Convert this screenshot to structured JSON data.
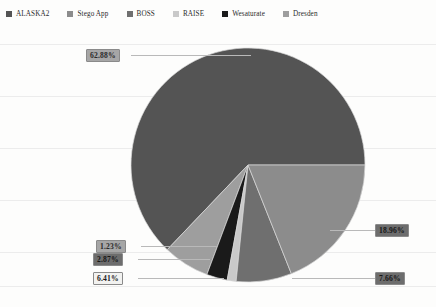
{
  "legend": {
    "position": "top",
    "items": [
      {
        "label": "ALASKA2",
        "color": "#545454",
        "icon": "legend-swatch-icon"
      },
      {
        "label": "Stego App",
        "color": "#8c8c8c",
        "icon": "legend-swatch-icon"
      },
      {
        "label": "BOSS",
        "color": "#6f6f6f",
        "icon": "legend-swatch-icon"
      },
      {
        "label": "RAISE",
        "color": "#c9c9c9",
        "icon": "legend-swatch-icon"
      },
      {
        "label": "Wesaturate",
        "color": "#1a1a1a",
        "icon": "legend-swatch-icon"
      },
      {
        "label": "Dresden",
        "color": "#9e9e9e",
        "icon": "legend-swatch-icon"
      }
    ]
  },
  "labels": {
    "alaska2": "62.88%",
    "stego_app": "18.96%",
    "boss": "7.66%",
    "dresden": "6.41%",
    "wesaturate": "2.87%",
    "raise": "1.23%"
  },
  "chart_data": {
    "type": "pie",
    "title": "",
    "categories": [
      "ALASKA2",
      "Stego App",
      "BOSS",
      "RAISE",
      "Wesaturate",
      "Dresden"
    ],
    "values": [
      62.88,
      18.96,
      7.66,
      1.23,
      2.87,
      6.41
    ],
    "value_labels": [
      "62.88%",
      "18.96%",
      "7.66%",
      "1.23%",
      "2.87%",
      "6.41%"
    ],
    "colors": [
      "#545454",
      "#8c8c8c",
      "#6f6f6f",
      "#c9c9c9",
      "#1a1a1a",
      "#9e9e9e"
    ],
    "units": "percent",
    "total": 100.01,
    "legend_position": "top",
    "grid": false,
    "start_angle_deg": 0,
    "direction": "counterclockwise"
  }
}
